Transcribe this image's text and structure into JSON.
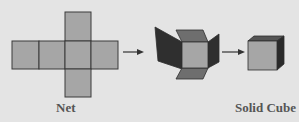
{
  "labels": {
    "net": "Net",
    "solid_cube": "Solid Cube"
  },
  "stages": [
    "net",
    "folding-cube",
    "solid-cube"
  ],
  "colors": {
    "background": "#e4e4e4",
    "face": "#a6a6a6",
    "face_mid": "#6b6b6b",
    "face_dark": "#333333",
    "outline": "#3a3a3a",
    "label": "#555555"
  }
}
